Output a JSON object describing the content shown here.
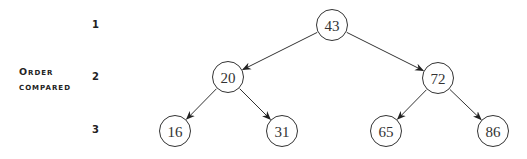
{
  "side_label": {
    "line1": "Order",
    "line2": "compared"
  },
  "levels": [
    "1",
    "2",
    "3"
  ],
  "tree": {
    "nodes": [
      {
        "id": "n43",
        "value": "43",
        "level": 1,
        "x": 332,
        "y": 25
      },
      {
        "id": "n20",
        "value": "20",
        "level": 2,
        "x": 228,
        "y": 77
      },
      {
        "id": "n72",
        "value": "72",
        "level": 2,
        "x": 438,
        "y": 78
      },
      {
        "id": "n16",
        "value": "16",
        "level": 3,
        "x": 175,
        "y": 131
      },
      {
        "id": "n31",
        "value": "31",
        "level": 3,
        "x": 282,
        "y": 131
      },
      {
        "id": "n65",
        "value": "65",
        "level": 3,
        "x": 386,
        "y": 131
      },
      {
        "id": "n86",
        "value": "86",
        "level": 3,
        "x": 493,
        "y": 131
      }
    ],
    "edges": [
      {
        "from": "43",
        "to": "20"
      },
      {
        "from": "43",
        "to": "72"
      },
      {
        "from": "20",
        "to": "16"
      },
      {
        "from": "20",
        "to": "31"
      },
      {
        "from": "72",
        "to": "65"
      },
      {
        "from": "72",
        "to": "86"
      }
    ]
  }
}
